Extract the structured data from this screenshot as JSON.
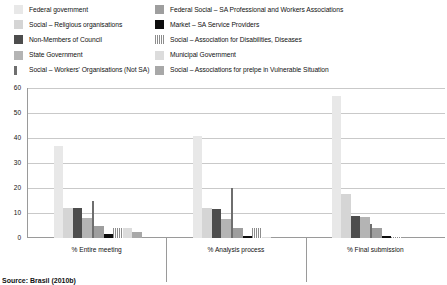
{
  "legend": {
    "left_column": [
      {
        "label": "Federal government",
        "color": "#e8e8e8",
        "pattern": "solid"
      },
      {
        "label": "Social – Religious organisations",
        "color": "#d5d5d5",
        "pattern": "solid"
      },
      {
        "label": "Non-Members of Council",
        "color": "#4d4d4d",
        "pattern": "solid"
      },
      {
        "label": "State Government",
        "color": "#b4b4b4",
        "pattern": "solid"
      },
      {
        "label": "Social – Workers' Organisations (Not SA)",
        "color": "#6e6e6e",
        "pattern": "narrow-solid"
      }
    ],
    "right_column": [
      {
        "label": "Federal Social – SA Professional and Workers Associations",
        "color": "#9e9e9e",
        "pattern": "solid"
      },
      {
        "label": "Market – SA Service Providers",
        "color": "#0d0d0d",
        "pattern": "solid"
      },
      {
        "label": "Social – Association for Disabilities, Diseases",
        "color": "#8c8c8c",
        "pattern": "vertical-stripes"
      },
      {
        "label": "Municipal Government",
        "color": "#dcdcdc",
        "pattern": "solid"
      },
      {
        "label": "Social – Associations for prelpe in Vulnerable Situation",
        "color": "#a8a8a8",
        "pattern": "solid"
      }
    ]
  },
  "axis": {
    "y_ticks": [
      "60",
      "50",
      "40",
      "30",
      "20",
      "10",
      "0"
    ],
    "y_min": 0,
    "y_max": 60
  },
  "source": "Source: Brasil (2010b)",
  "chart_data": {
    "type": "bar",
    "title": "",
    "subtitle": "",
    "xlabel": "",
    "ylabel": "",
    "ylim": [
      0,
      60
    ],
    "grid": true,
    "legend_position": "top",
    "categories": [
      "% Entire meeting",
      "% Analysis process",
      "% Final submission"
    ],
    "series": [
      {
        "name": "Federal government",
        "color": "#e8e8e8",
        "pattern": "solid",
        "values": [
          37,
          41,
          57
        ]
      },
      {
        "name": "Social – Religious organisations",
        "color": "#d5d5d5",
        "pattern": "solid",
        "values": [
          12,
          12,
          17.5
        ]
      },
      {
        "name": "Non-Members of Council",
        "color": "#4d4d4d",
        "pattern": "solid",
        "values": [
          12,
          11.5,
          9
        ]
      },
      {
        "name": "State Government",
        "color": "#b4b4b4",
        "pattern": "solid",
        "values": [
          8,
          7.5,
          8.5
        ]
      },
      {
        "name": "Social – Workers' Organisations (Not SA)",
        "color": "#6e6e6e",
        "pattern": "narrow-solid",
        "values": [
          15,
          20,
          5.5
        ]
      },
      {
        "name": "Federal Social – SA Professional and Workers Associations",
        "color": "#9e9e9e",
        "pattern": "solid",
        "values": [
          5,
          4,
          4
        ]
      },
      {
        "name": "Market – SA Service Providers",
        "color": "#0d0d0d",
        "pattern": "solid",
        "values": [
          1.5,
          1,
          1
        ]
      },
      {
        "name": "Social – Association for Disabilities, Diseases",
        "color": "#8c8c8c",
        "pattern": "vertical-stripes",
        "values": [
          4,
          4,
          0.3
        ]
      },
      {
        "name": "Municipal Government",
        "color": "#dcdcdc",
        "pattern": "solid",
        "values": [
          4,
          0.3,
          0
        ]
      },
      {
        "name": "Social – Associations for prelpe in Vulnerable Situation",
        "color": "#a8a8a8",
        "pattern": "solid",
        "values": [
          2.5,
          0,
          0
        ]
      }
    ]
  }
}
